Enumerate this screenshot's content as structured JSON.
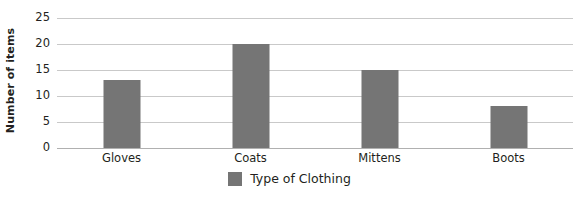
{
  "chart_data": {
    "type": "bar",
    "title": "",
    "subtitle": "",
    "categories": [
      "Gloves",
      "Coats",
      "Mittens",
      "Boots"
    ],
    "values": [
      13,
      20,
      15,
      8
    ],
    "series": [
      {
        "name": "Type of Clothing",
        "values": [
          13,
          20,
          15,
          8
        ]
      }
    ],
    "xlabel": "",
    "ylabel": "Number of items",
    "ylim": [
      0,
      25
    ],
    "yticks": [
      0,
      5,
      10,
      15,
      20,
      25
    ],
    "ytick_labels": [
      "0",
      "5",
      "10",
      "15",
      "20",
      "25"
    ],
    "grid": true,
    "grid_axis": "y",
    "legend": {
      "position": "bottom-center",
      "entries": [
        {
          "label": "Type of Clothing",
          "color": "#757575"
        }
      ]
    },
    "annotations": []
  },
  "colors": {
    "bar": "#757575",
    "gridline": "#c9c9c9",
    "baseline": "#b0b0b0",
    "text": "#231f20",
    "background": "#ffffff"
  }
}
